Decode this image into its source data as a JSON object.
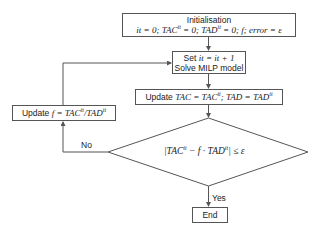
{
  "diagram": {
    "type": "flowchart",
    "nodes": {
      "init": {
        "title": "Initialisation",
        "formula": "it = 0; TAC^it = 0; TAD^it = 0; f; error = ε",
        "parts": [
          "it = 0; TAC",
          "it",
          " = 0; TAD",
          "it",
          " = 0; f; error = ε"
        ]
      },
      "solve": {
        "line1_prefix": "Set ",
        "line1_math": "it = it + 1",
        "line2": "Solve MILP model"
      },
      "update_tac": {
        "prefix": "Update ",
        "parts": [
          "TAC = TAC",
          "it",
          "; TAD = TAD",
          "it"
        ]
      },
      "decision": {
        "formula": "|TAC^it − f · TAD^it| ≤ ε",
        "parts": [
          "|TAC",
          "it",
          " − f · TAD",
          "it",
          "| ≤ ε"
        ]
      },
      "update_f": {
        "prefix": "Update ",
        "parts": [
          "f = TAC",
          "it",
          "/TAD",
          "it"
        ]
      },
      "end": {
        "label": "End"
      }
    },
    "edges": {
      "no_label": "No",
      "yes_label": "Yes"
    },
    "colors": {
      "line": "#555555",
      "box_border": "#555555",
      "text": "#222222",
      "background": "#ffffff"
    }
  }
}
